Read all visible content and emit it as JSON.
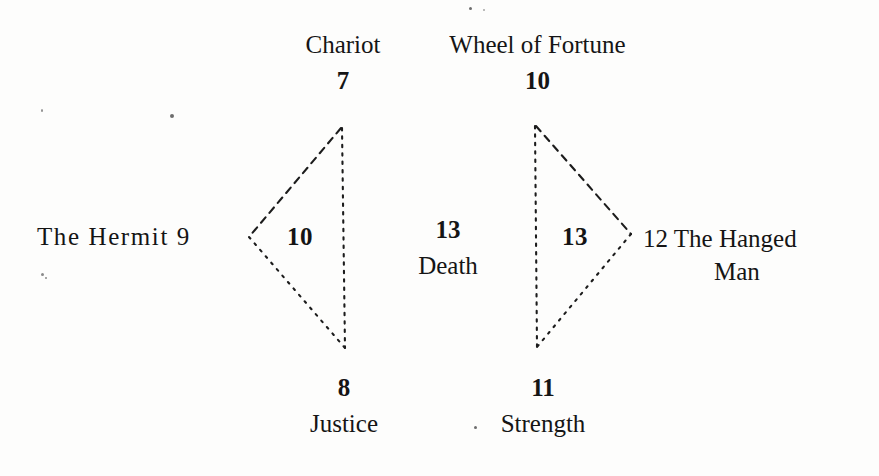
{
  "figure": {
    "type": "tarot-trump-diagram",
    "background_color": "#fdfdfc",
    "ink_color": "#141414",
    "nodes": {
      "top_left": {
        "name": "Chariot",
        "number": "7"
      },
      "top_right": {
        "name": "Wheel of Fortune",
        "number": "10"
      },
      "left": {
        "name": "The Hermit",
        "number": "9",
        "inline": "The Hermit  9"
      },
      "right": {
        "name": "The Hanged Man",
        "number": "12",
        "line1": "12 The Hanged",
        "line2": "Man"
      },
      "center": {
        "name": "Death",
        "number": "13"
      },
      "bottom_left": {
        "name": "Justice",
        "number": "8"
      },
      "bottom_right": {
        "name": "Strength",
        "number": "11"
      }
    },
    "interior_labels": {
      "left_triangle": "10",
      "right_triangle": "13"
    },
    "line_style": {
      "upper_edges": "dashed",
      "lower_edges": "dotted",
      "vertical_axis": "dotted"
    }
  }
}
